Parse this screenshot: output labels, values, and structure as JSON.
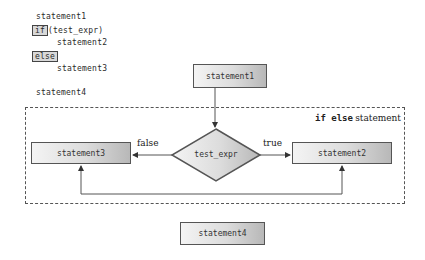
{
  "code": {
    "lines": [
      {
        "indent": 0,
        "text": "statement1"
      },
      {
        "indent": 0,
        "keyword": "if",
        "text": "(test_expr)"
      },
      {
        "indent": 1,
        "text": "statement2"
      },
      {
        "indent": 0,
        "keyword": "else",
        "text": ""
      },
      {
        "indent": 1,
        "text": "statement3"
      },
      {
        "indent": 0,
        "text": "statement4"
      }
    ]
  },
  "flowchart": {
    "region_label": {
      "keywords": "if else",
      "text": "statement"
    },
    "nodes": {
      "statement1": "statement1",
      "decision": "test_expr",
      "statement2": "statement2",
      "statement3": "statement3",
      "statement4": "statement4"
    },
    "edges": {
      "false_label": "false",
      "true_label": "true"
    }
  },
  "colors": {
    "border": "#555555",
    "fill_light": "#f4f4f4",
    "fill_dark": "#b8b8b8",
    "keyword_fill": "#d8d8d8"
  }
}
